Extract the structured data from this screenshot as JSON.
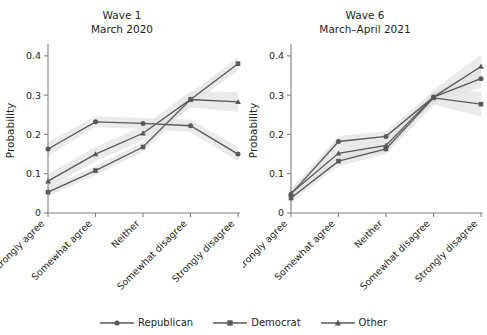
{
  "chart_data": [
    {
      "type": "line",
      "title": "Wave 1\nMarch 2020",
      "panel": "Wave 1",
      "subtitle": "March 2020",
      "xlabel": "",
      "ylabel": "Probability",
      "categories": [
        "Strongly agree",
        "Somewhat agree",
        "Neither",
        "Somewhat disagree",
        "Strongly disagree"
      ],
      "yticks": [
        "0",
        "0.1",
        "0.2",
        "0.3",
        "0.4"
      ],
      "ytickvalues": [
        0,
        0.1,
        0.2,
        0.3,
        0.4
      ],
      "ylim": [
        0,
        0.42
      ],
      "grid": false,
      "legend_position": "bottom",
      "series": [
        {
          "name": "Republican",
          "marker": "circle",
          "values": [
            0.163,
            0.232,
            0.228,
            0.222,
            0.15
          ],
          "band_low": [
            0.145,
            0.218,
            0.214,
            0.206,
            0.132
          ],
          "band_high": [
            0.181,
            0.246,
            0.242,
            0.238,
            0.168
          ]
        },
        {
          "name": "Democrat",
          "marker": "square",
          "values": [
            0.053,
            0.108,
            0.168,
            0.289,
            0.38
          ],
          "band_low": [
            0.042,
            0.096,
            0.155,
            0.274,
            0.362
          ],
          "band_high": [
            0.064,
            0.12,
            0.181,
            0.304,
            0.398
          ]
        },
        {
          "name": "Other",
          "marker": "triangle",
          "values": [
            0.081,
            0.15,
            0.203,
            0.289,
            0.283
          ],
          "band_low": [
            0.062,
            0.132,
            0.185,
            0.268,
            0.258
          ],
          "band_high": [
            0.1,
            0.168,
            0.221,
            0.31,
            0.308
          ]
        }
      ]
    },
    {
      "type": "line",
      "title": "Wave 6\nMarch–April 2021",
      "panel": "Wave 6",
      "subtitle": "March–April 2021",
      "xlabel": "",
      "ylabel": "Probability",
      "categories": [
        "Strongly agree",
        "Somewhat agree",
        "Neither",
        "Somewhat disagree",
        "Strongly disagree"
      ],
      "yticks": [
        "0",
        "0.1",
        "0.2",
        "0.3",
        "0.4"
      ],
      "ytickvalues": [
        0,
        0.1,
        0.2,
        0.3,
        0.4
      ],
      "ylim": [
        0,
        0.42
      ],
      "grid": false,
      "legend_position": "bottom",
      "series": [
        {
          "name": "Republican",
          "marker": "circle",
          "values": [
            0.048,
            0.182,
            0.195,
            0.295,
            0.342
          ],
          "band_low": [
            0.036,
            0.168,
            0.182,
            0.28,
            0.318
          ],
          "band_high": [
            0.06,
            0.196,
            0.208,
            0.31,
            0.366
          ]
        },
        {
          "name": "Democrat",
          "marker": "square",
          "values": [
            0.038,
            0.132,
            0.163,
            0.293,
            0.277
          ],
          "band_low": [
            0.028,
            0.119,
            0.15,
            0.276,
            0.245
          ],
          "band_high": [
            0.048,
            0.145,
            0.176,
            0.31,
            0.309
          ]
        },
        {
          "name": "Other",
          "marker": "triangle",
          "values": [
            0.05,
            0.152,
            0.172,
            0.295,
            0.373
          ],
          "band_low": [
            0.036,
            0.136,
            0.156,
            0.276,
            0.344
          ],
          "band_high": [
            0.064,
            0.168,
            0.188,
            0.314,
            0.402
          ]
        }
      ]
    }
  ],
  "legend": {
    "items": [
      {
        "label": "Republican",
        "marker": "circle"
      },
      {
        "label": "Democrat",
        "marker": "square"
      },
      {
        "label": "Other",
        "marker": "triangle"
      }
    ]
  },
  "colors": {
    "line": "#595959",
    "band": "#e3e3e3",
    "axis": "#808080",
    "text": "#231f20"
  }
}
